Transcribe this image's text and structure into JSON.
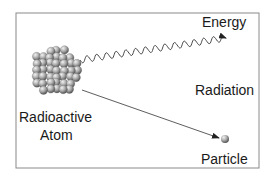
{
  "diagram": {
    "labels": {
      "energy": "Energy",
      "radiation": "Radiation",
      "atom_line1": "Radioactive",
      "atom_line2": "Atom",
      "particle": "Particle"
    },
    "colors": {
      "border": "#8a8a8a",
      "line": "#333333",
      "sphere_light": "#e6e6e6",
      "sphere_mid": "#a6a6a6",
      "sphere_dark": "#5a5a5a",
      "text": "#1a1a1a"
    },
    "elements": {
      "nucleus": "nucleus-cluster-icon",
      "energy_wave": "wavy-arrow-icon",
      "particle_path": "straight-arrow-icon",
      "particle": "sphere-icon"
    }
  }
}
